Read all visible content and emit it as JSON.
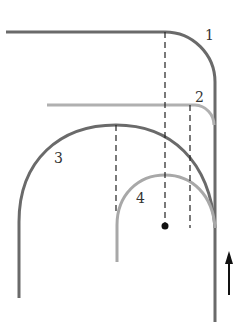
{
  "diagram": {
    "labels": [
      "1",
      "2",
      "3",
      "4"
    ],
    "colors": {
      "curve_dark": "#666666",
      "curve_light": "#aaaaaa",
      "dashes": "#222222",
      "arrow": "#111111"
    },
    "elements": {
      "curve_1": "horizontal path turning down into vertical",
      "curve_2": "light horizontal path turning down",
      "curve_3": "large arch",
      "curve_4": "small light arch",
      "center_point": "dot",
      "direction_arrow": "up"
    }
  }
}
